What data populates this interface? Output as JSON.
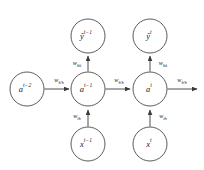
{
  "figure": {
    "background_color": "#ffffff",
    "node_stroke_color": "#4a4a4a",
    "edge_color": "#3a3a3a",
    "text_color": "#1a1a1a"
  },
  "nodes": {
    "hidden_prev2": {
      "base": "a",
      "sup": "t−2",
      "full": "a^{t-2}",
      "cx": 27,
      "cy": 89,
      "r": 17
    },
    "hidden_prev": {
      "base": "a",
      "sup": "t−1",
      "full": "a^{t-1}",
      "cx": 88,
      "cy": 89,
      "r": 17
    },
    "hidden_cur": {
      "base": "a",
      "sup": "t",
      "full": "a^{t}",
      "cx": 150,
      "cy": 89,
      "r": 17
    },
    "output_prev": {
      "base": "ŷ",
      "sup": "t−1",
      "full": "ŷ^{t-1}",
      "cx": 88,
      "cy": 36,
      "r": 17
    },
    "output_cur": {
      "base": "ŷ",
      "sup": "t",
      "full": "ŷ^{t}",
      "cx": 150,
      "cy": 36,
      "r": 17
    },
    "input_prev": {
      "base": "x",
      "sup": "t−1",
      "full": "x^{t-1}",
      "cx": 88,
      "cy": 144,
      "r": 17
    },
    "input_cur": {
      "base": "x",
      "sup": "t",
      "full": "x^{t}",
      "cx": 150,
      "cy": 144,
      "r": 17
    }
  },
  "edges": [
    {
      "id": "recurrent-in-left",
      "label_base": "w",
      "label_sub": "h′h",
      "label_full": "w_{h′h}",
      "from": "hidden_prev2",
      "to": "hidden_prev",
      "direction": "right",
      "label_x": 59,
      "label_y": 81
    },
    {
      "id": "recurrent-middle",
      "label_base": "w",
      "label_sub": "h′h",
      "label_full": "w_{h′h}",
      "from": "hidden_prev",
      "to": "hidden_cur",
      "direction": "right",
      "label_x": 119,
      "label_y": 81
    },
    {
      "id": "recurrent-out-right",
      "label_base": "w",
      "label_sub": "h′h",
      "label_full": "w_{h′h}",
      "from": "hidden_cur",
      "to": "next",
      "direction": "right",
      "label_x": 182,
      "label_y": 81
    },
    {
      "id": "hidden-to-output-prev",
      "label_base": "w",
      "label_sub": "hk",
      "label_full": "w_{hk}",
      "from": "hidden_prev",
      "to": "output_prev",
      "direction": "up",
      "label_x": 77,
      "label_y": 64
    },
    {
      "id": "hidden-to-output-cur",
      "label_base": "w",
      "label_sub": "hk",
      "label_full": "w_{hk}",
      "from": "hidden_cur",
      "to": "output_cur",
      "direction": "up",
      "label_x": 162,
      "label_y": 64
    },
    {
      "id": "input-to-hidden-prev",
      "label_base": "w",
      "label_sub": "ih",
      "label_full": "w_{ih}",
      "from": "input_prev",
      "to": "hidden_prev",
      "direction": "up",
      "label_x": 77,
      "label_y": 117
    },
    {
      "id": "input-to-hidden-cur",
      "label_base": "w",
      "label_sub": "ih",
      "label_full": "w_{ih}",
      "from": "input_cur",
      "to": "hidden_cur",
      "direction": "up",
      "label_x": 162,
      "label_y": 117
    }
  ]
}
